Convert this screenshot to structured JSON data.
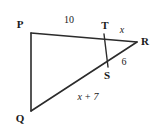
{
  "figure": {
    "type": "geometry-diagram",
    "shape": "triangle-with-cevian",
    "background_color": "#ffffff",
    "stroke_color": "#2b2b2b",
    "label_color": "#1a1a1a",
    "vertices": [
      {
        "name": "P",
        "label": "P",
        "point_x": 31,
        "point_y": 33,
        "label_x": 20,
        "label_y": 24
      },
      {
        "name": "T",
        "label": "T",
        "point_x": 105,
        "point_y": 34,
        "label_x": 105,
        "label_y": 25
      },
      {
        "name": "R",
        "label": "R",
        "point_x": 137,
        "point_y": 42,
        "label_x": 145,
        "label_y": 41
      },
      {
        "name": "S",
        "label": "S",
        "point_x": 107,
        "point_y": 66,
        "label_x": 107,
        "label_y": 75
      },
      {
        "name": "Q",
        "label": "Q",
        "point_x": 31,
        "point_y": 111,
        "label_x": 20,
        "label_y": 118
      }
    ],
    "segments": [
      {
        "name": "segment-PQ",
        "from": "P",
        "to": "Q",
        "x1": 31,
        "y1": 33,
        "x2": 31,
        "y2": 111
      },
      {
        "name": "segment-PR",
        "from": "P",
        "to": "R",
        "x1": 31,
        "y1": 33,
        "x2": 137,
        "y2": 42
      },
      {
        "name": "segment-QR",
        "from": "Q",
        "to": "R",
        "x1": 31,
        "y1": 111,
        "x2": 137,
        "y2": 42
      },
      {
        "name": "segment-TS",
        "from": "T",
        "to": "S",
        "x1": 104,
        "y1": 34,
        "x2": 108,
        "y2": 67
      }
    ],
    "measures": [
      {
        "name": "measure-PT",
        "text": "10",
        "x": 69,
        "y": 20,
        "italic": false
      },
      {
        "name": "measure-TR",
        "text": "x",
        "x": 122,
        "y": 30,
        "italic": true
      },
      {
        "name": "measure-SR",
        "text": "6",
        "x": 124,
        "y": 62,
        "italic": false
      },
      {
        "name": "measure-QS",
        "text": "x + 7",
        "x": 88,
        "y": 97,
        "italic": true
      }
    ]
  }
}
